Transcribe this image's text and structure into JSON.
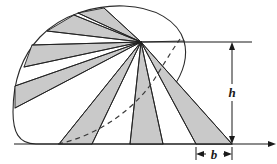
{
  "figure": {
    "background_color": "#ffffff",
    "outline_color": "#2b2b2b",
    "wedge_fill_color": "#c9c9c9",
    "wedge_stroke_color": "#1f1f1f",
    "dimension_color": "#1a1a1a",
    "dashed_color": "#3a3a3a"
  },
  "labels": {
    "height": "h",
    "base": "b"
  },
  "geometry": {
    "apex": {
      "x": 141,
      "y": 42
    },
    "baseline_y": 144,
    "baseline_start_x": 14,
    "baseline_end_x": 272,
    "top_rule_y": 42,
    "top_rule_start_x": 141,
    "top_rule_end_x": 252,
    "h_line_x": 232,
    "h_top_y": 42,
    "h_bottom_y": 144,
    "b_line_y": 154,
    "b_left_x": 196,
    "b_right_x": 232
  },
  "wedges": [
    {
      "name": "wedge-1",
      "shaded": true
    },
    {
      "name": "wedge-2",
      "shaded": false
    },
    {
      "name": "wedge-3",
      "shaded": true
    },
    {
      "name": "wedge-4",
      "shaded": false
    },
    {
      "name": "wedge-5",
      "shaded": true
    },
    {
      "name": "wedge-6",
      "shaded": false
    },
    {
      "name": "wedge-7",
      "shaded": true
    },
    {
      "name": "wedge-8",
      "shaded": false
    },
    {
      "name": "wedge-9",
      "shaded": true
    },
    {
      "name": "wedge-10",
      "shaded": false
    },
    {
      "name": "wedge-11",
      "shaded": true
    },
    {
      "name": "wedge-12",
      "shaded": false
    },
    {
      "name": "wedge-13",
      "shaded": true
    }
  ]
}
